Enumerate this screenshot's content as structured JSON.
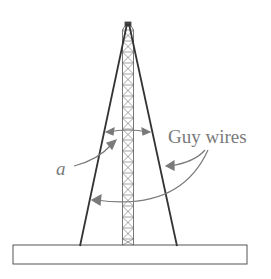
{
  "diagram": {
    "labels": {
      "guy_wires": "Guy wires",
      "angle": "a"
    },
    "colors": {
      "structure": "#3a3a3a",
      "annotation": "#7a7a7a",
      "background": "#ffffff"
    },
    "elements": [
      "tower",
      "left-guy-wire",
      "right-guy-wire",
      "base-slab",
      "angle-arc",
      "label-arrows"
    ]
  }
}
